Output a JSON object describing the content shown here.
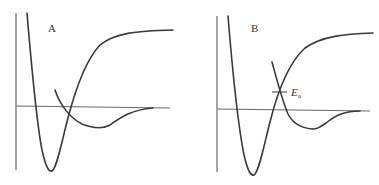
{
  "diagram": {
    "type": "potential-energy-curves",
    "panels": [
      {
        "id": "A",
        "label": "A",
        "description": "Two potential energy curves: a deep well curve and a shallow well curve crossing below the energy axis"
      },
      {
        "id": "B",
        "label": "B",
        "description": "Two potential energy curves crossing above the zero axis, with activation energy marked",
        "annotation": {
          "symbol": "E",
          "subscript": "a"
        }
      }
    ],
    "colors": {
      "curve": "#3a3a3a",
      "axis": "#6a6a6a",
      "background": "#ffffff"
    }
  }
}
